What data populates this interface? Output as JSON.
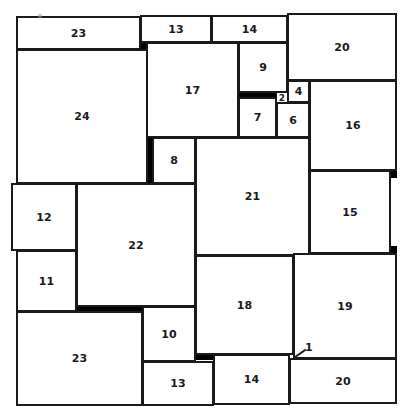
{
  "diagram": {
    "squares": [
      {
        "label": "23",
        "x": 16,
        "y": 16,
        "w": 125,
        "h": 34
      },
      {
        "label": "13",
        "x": 140,
        "y": 15,
        "w": 72,
        "h": 28
      },
      {
        "label": "14",
        "x": 211,
        "y": 15,
        "w": 77,
        "h": 28
      },
      {
        "label": "20",
        "x": 287,
        "y": 13,
        "w": 110,
        "h": 68
      },
      {
        "label": "24",
        "x": 16,
        "y": 49,
        "w": 132,
        "h": 135
      },
      {
        "label": "17",
        "x": 146,
        "y": 42,
        "w": 93,
        "h": 96
      },
      {
        "label": "9",
        "x": 238,
        "y": 42,
        "w": 50,
        "h": 51
      },
      {
        "label": "2",
        "x": 276,
        "y": 92,
        "w": 12,
        "h": 11
      },
      {
        "label": "4",
        "x": 287,
        "y": 80,
        "w": 23,
        "h": 23
      },
      {
        "label": "7",
        "x": 238,
        "y": 97,
        "w": 39,
        "h": 41
      },
      {
        "label": "6",
        "x": 276,
        "y": 102,
        "w": 34,
        "h": 36
      },
      {
        "label": "16",
        "x": 309,
        "y": 80,
        "w": 88,
        "h": 91
      },
      {
        "label": "8",
        "x": 152,
        "y": 137,
        "w": 44,
        "h": 47
      },
      {
        "label": "21",
        "x": 195,
        "y": 137,
        "w": 115,
        "h": 119
      },
      {
        "label": "15",
        "x": 309,
        "y": 170,
        "w": 82,
        "h": 84
      },
      {
        "label": "12",
        "x": 11,
        "y": 183,
        "w": 66,
        "h": 68
      },
      {
        "label": "22",
        "x": 76,
        "y": 183,
        "w": 120,
        "h": 124
      },
      {
        "label": "11",
        "x": 16,
        "y": 250,
        "w": 61,
        "h": 62
      },
      {
        "label": "18",
        "x": 195,
        "y": 255,
        "w": 99,
        "h": 100
      },
      {
        "label": "19",
        "x": 293,
        "y": 253,
        "w": 104,
        "h": 106
      },
      {
        "label": "23",
        "x": 16,
        "y": 311,
        "w": 127,
        "h": 95
      },
      {
        "label": "10",
        "x": 142,
        "y": 306,
        "w": 54,
        "h": 56
      },
      {
        "label": "13",
        "x": 142,
        "y": 361,
        "w": 72,
        "h": 45
      },
      {
        "label": "14",
        "x": 213,
        "y": 354,
        "w": 77,
        "h": 51
      },
      {
        "label": "20",
        "x": 289,
        "y": 358,
        "w": 108,
        "h": 46
      }
    ],
    "gaps": [
      {
        "x": 140,
        "y": 42,
        "w": 7,
        "h": 7
      },
      {
        "x": 146,
        "y": 137,
        "w": 7,
        "h": 47
      },
      {
        "x": 238,
        "y": 92,
        "w": 38,
        "h": 6
      },
      {
        "x": 390,
        "y": 170,
        "w": 7,
        "h": 8
      },
      {
        "x": 390,
        "y": 246,
        "w": 7,
        "h": 8
      },
      {
        "x": 76,
        "y": 306,
        "w": 67,
        "h": 6
      },
      {
        "x": 195,
        "y": 354,
        "w": 18,
        "h": 6
      }
    ],
    "small_square": {
      "label": "1",
      "x": 289,
      "y": 354,
      "w": 5,
      "h": 5,
      "label_x": 305,
      "label_y": 341,
      "leader": {
        "x": 295,
        "y": 356,
        "len": 13,
        "angle": -35
      }
    },
    "marker_dot": {
      "x": 38,
      "y": 14
    },
    "stroke_color": "#1a1a1a",
    "fill_color": "#ffffff",
    "gap_color": "#000000"
  }
}
